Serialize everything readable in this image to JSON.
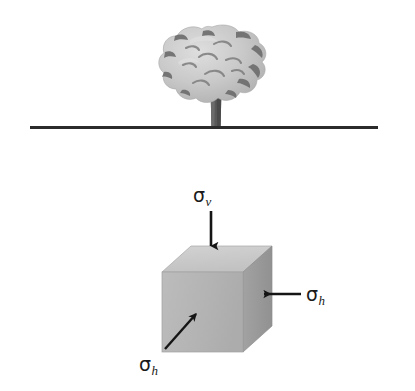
{
  "figure": {
    "background_color": "#ffffff",
    "width": 415,
    "height": 391
  },
  "scene": {
    "ground": {
      "name": "ground-surface-line",
      "color": "#2b2b2b",
      "x_start": 30,
      "x_end": 378,
      "y": 127,
      "thickness": 3
    },
    "tree": {
      "name": "tree",
      "crown_color": "#c6c6c6",
      "crown_shade_color": "#6d6d6d",
      "crown_highlight_color": "#dcdcdc",
      "trunk_color": "#5c5c5c",
      "center_x": 212,
      "crown_top": 27,
      "crown_bottom": 110,
      "trunk_top": 88,
      "trunk_bottom": 127
    },
    "cube": {
      "name": "soil-element-cube",
      "front_face_color": "#b4b4b4",
      "top_face_color": "#cacaca",
      "side_face_color": "#9b9b9b",
      "edge_color": "#8a8a8a",
      "front_left": 162,
      "front_right": 243,
      "front_top": 272,
      "front_bottom": 352,
      "depth_x": 29,
      "depth_y": 26
    }
  },
  "arrows": {
    "vertical": {
      "name": "vertical-stress-arrow",
      "direction": "down",
      "color": "#151515",
      "x": 211,
      "y_start": 211,
      "y_end": 253
    },
    "horizontal_right": {
      "name": "horizontal-stress-arrow-right",
      "direction": "left",
      "color": "#151515",
      "y": 294,
      "x_start": 301,
      "x_end": 257
    },
    "diagonal_front": {
      "name": "horizontal-stress-arrow-front",
      "direction": "up-right",
      "color": "#151515",
      "x_start": 165,
      "y_start": 349,
      "x_end": 201,
      "y_end": 309
    }
  },
  "labels": {
    "sigma_v": {
      "name": "sigma-v-label",
      "symbol": "σ",
      "subscript": "v",
      "meaning": "vertical stress"
    },
    "sigma_h_right": {
      "name": "sigma-h-label-right",
      "symbol": "σ",
      "subscript": "h",
      "meaning": "horizontal stress"
    },
    "sigma_h_bottom": {
      "name": "sigma-h-label-bottom",
      "symbol": "σ",
      "subscript": "h",
      "meaning": "horizontal stress"
    }
  }
}
